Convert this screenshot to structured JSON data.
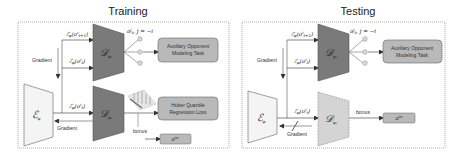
{
  "panels": {
    "training": {
      "title": "Training",
      "encoder_label": "ℰφ",
      "decoder_opponent_label": "𝒟ψ₁",
      "decoder_quantile_label": "𝒟ψᵤ",
      "input_next_obs": "ℰφ(oᵢₜ₊₁)",
      "input_obs_upper": "ℰφ(oᵢₜ)",
      "input_obs_lower": "ℰφ(oᵢₜ)",
      "opponent_actions": "aʲₜ, j = −i",
      "gradient_upper": "Gradient",
      "gradient_lower": "Gradient",
      "aux_task": [
        "Auxiliary Opponent",
        "Modeling Task"
      ],
      "huber_task": [
        "Huber Quantile",
        "Regression Loss"
      ],
      "bonus": "bonus",
      "intrinsic_reward": "aⁱⁿ"
    },
    "testing": {
      "title": "Testing",
      "encoder_label": "ℰφ",
      "decoder_opponent_label": "𝒟ψ₁",
      "decoder_quantile_label": "𝒟ψᵤ",
      "input_next_obs": "ℰφ(oᵢₜ₊₁)",
      "input_obs_upper": "ℰφ(oᵢₜ)",
      "input_obs_lower": "ℰφ(oᵢₜ)",
      "opponent_actions": "aʲₜ, j = −i",
      "gradient_upper": "Gradient",
      "gradient_lower": "Gradient",
      "aux_task": [
        "Auxiliary Opponent",
        "Modeling Task"
      ],
      "bonus": "bonus",
      "intrinsic_reward": "aⁱⁿ"
    }
  },
  "colors": {
    "decoder_dark": "#7a7a7a",
    "decoder_frozen": "#d4d4d4",
    "encoder_fill": "#f4f4f4",
    "task_box": "#b9b9b9",
    "output_circle": "#d9d9d9",
    "border_dotted": "#888888"
  }
}
